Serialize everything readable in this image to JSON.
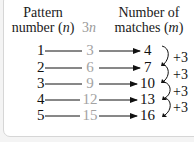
{
  "headers": {
    "col1_line1": "Pattern",
    "col1_line2_prefix": "number (",
    "col1_var": "n",
    "col1_suffix": ")",
    "col2_prefix": "3",
    "col2_var": "n",
    "col3_line1": "Number of",
    "col3_line2_prefix": "matches (",
    "col3_var": "m",
    "col3_suffix": ")"
  },
  "rows": [
    {
      "n": "1",
      "three_n": "3",
      "m": "4"
    },
    {
      "n": "2",
      "three_n": "6",
      "m": "7"
    },
    {
      "n": "3",
      "three_n": "9",
      "m": "10"
    },
    {
      "n": "4",
      "three_n": "12",
      "m": "13"
    },
    {
      "n": "5",
      "three_n": "15",
      "m": "16"
    }
  ],
  "differences": [
    "+3",
    "+3",
    "+3",
    "+3"
  ],
  "colors": {
    "text": "#111111",
    "muted": "#a3a3a3",
    "border": "#d6d6d6",
    "panel": "#ffffff"
  }
}
